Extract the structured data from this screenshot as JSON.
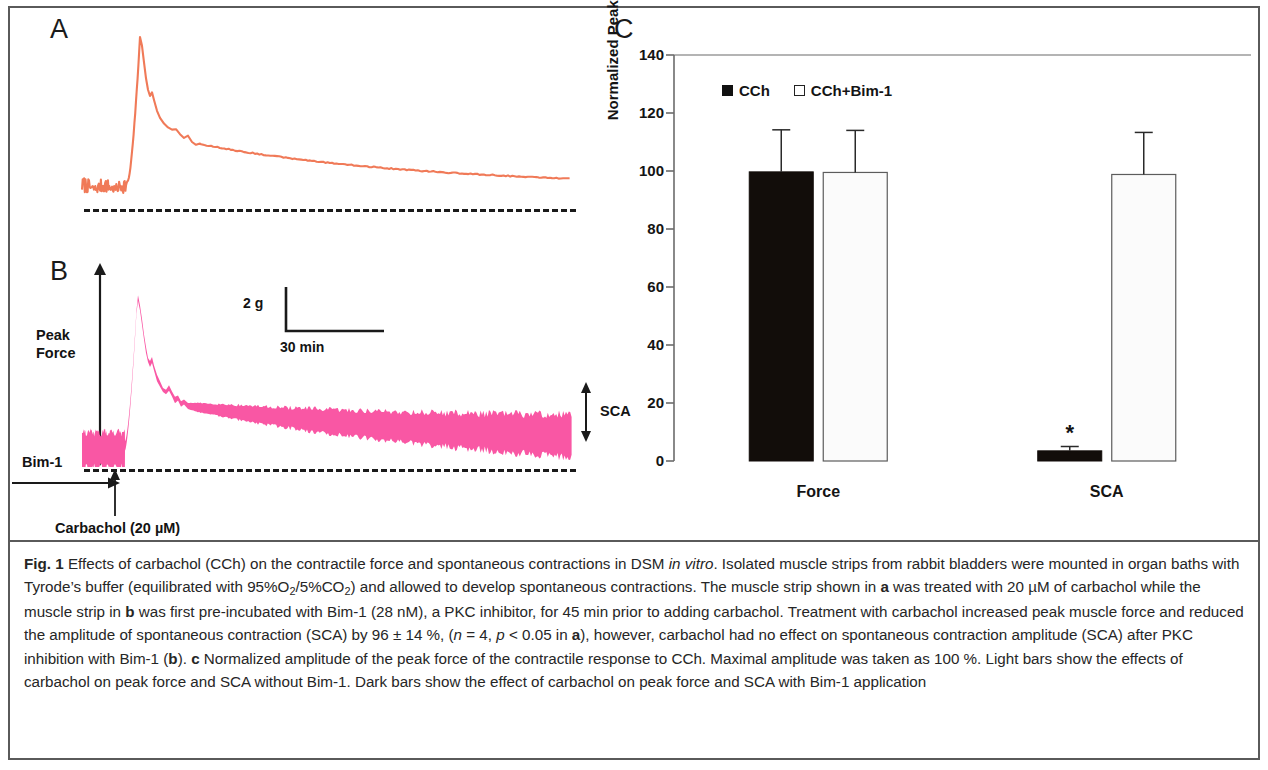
{
  "figure": {
    "panel_a_letter": "A",
    "panel_b_letter": "B",
    "panel_c_letter": "C"
  },
  "panel_b": {
    "peak_force_label_line1": "Peak",
    "peak_force_label_line2": "Force",
    "sca_label": "SCA",
    "bim1_label": "Bim-1",
    "carbachol_label": "Carbachol (20 µM)",
    "scale_vertical": "2 g",
    "scale_horizontal": "30 min"
  },
  "colors": {
    "trace_a": "#F07A58",
    "trace_b": "#F957A4",
    "axis": "#6b6b6b",
    "bar_dark": "#120d0a",
    "bar_light": "#fbfbfb",
    "text": "#141414",
    "rule": "#5a5a5a"
  },
  "chart_data": {
    "type": "bar",
    "title": "",
    "xlabel": "",
    "ylabel": "Normalized Peak Force (%)",
    "ylim": [
      0,
      140
    ],
    "yticks": [
      0,
      20,
      40,
      60,
      80,
      100,
      120,
      140
    ],
    "ytick_labels": [
      "0",
      "20",
      "40",
      "60",
      "80",
      "100",
      "120",
      "140"
    ],
    "grid": false,
    "legend_position": "top-center",
    "categories": [
      "Force",
      "SCA"
    ],
    "series": [
      {
        "name": "CCh",
        "style": "dark",
        "values": [
          99.7,
          3.5
        ],
        "errors": [
          14.5,
          1.5
        ],
        "annotations": [
          "",
          "*"
        ]
      },
      {
        "name": "CCh+Bim-1",
        "style": "light",
        "values": [
          99.5,
          98.8
        ],
        "errors": [
          14.5,
          14.5
        ],
        "annotations": [
          "",
          ""
        ]
      }
    ],
    "significance_marker": "*"
  },
  "caption": {
    "prefix": "Fig. 1",
    "segments": [
      {
        "t": " Effects of carbachol (CCh) on the contractile force and spontaneous contractions in DSM "
      },
      {
        "t": "in vitro",
        "i": true
      },
      {
        "t": ". Isolated muscle strips from rabbit bladders were mounted in organ baths with Tyrode’s buffer (equilibrated with 95%O"
      },
      {
        "t": "2",
        "sub": true
      },
      {
        "t": "/5%CO"
      },
      {
        "t": "2",
        "sub": true
      },
      {
        "t": ") and allowed to develop spontaneous contractions. The muscle strip shown in "
      },
      {
        "t": "a",
        "b": true
      },
      {
        "t": " was treated with 20 µM of carbachol while the muscle strip in "
      },
      {
        "t": "b",
        "b": true
      },
      {
        "t": " was first pre-incubated with Bim-1 (28 nM), a PKC inhibitor, for 45 min prior to adding carbachol. Treatment with carbachol increased peak muscle force and reduced the amplitude of spontaneous contraction (SCA) by 96 ± 14 %, ("
      },
      {
        "t": "n",
        "i": true
      },
      {
        "t": " = 4, "
      },
      {
        "t": "p",
        "i": true
      },
      {
        "t": " < 0.05 in "
      },
      {
        "t": "a",
        "b": true
      },
      {
        "t": "), however, carbachol had no effect on spontaneous contraction amplitude (SCA) after PKC inhibition with Bim-1 ("
      },
      {
        "t": "b",
        "b": true
      },
      {
        "t": "). "
      },
      {
        "t": "c",
        "b": true
      },
      {
        "t": " Normalized amplitude of the peak force of the contractile response to CCh. Maximal amplitude was taken as 100 %. Light bars show the effects of carbachol on peak force and SCA without Bim-1. Dark bars show the effect of carbachol on peak force and SCA with Bim-1 application"
      }
    ]
  }
}
